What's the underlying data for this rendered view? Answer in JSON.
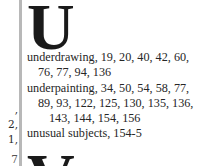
{
  "left_column": {
    "fragments": [
      {
        "text": ",",
        "top": 105
      },
      {
        "text": "2,",
        "top": 120
      },
      {
        "text": "1,",
        "top": 135
      },
      {
        "text": "7",
        "top": 153
      }
    ]
  },
  "section_u": {
    "letter": "U",
    "entries": [
      {
        "term": "underdrawing",
        "lines": [
          "underdrawing, 19, 20, 40, 42, 60,",
          "76, 77, 94, 136"
        ]
      },
      {
        "term": "underpainting",
        "lines": [
          "underpainting, 34, 50, 54, 58, 77,",
          "89, 93, 122, 125, 130, 135, 136,",
          "143, 144, 154, 156"
        ]
      },
      {
        "term": "unusual subjects",
        "lines": [
          "unusual subjects, 154-5"
        ]
      }
    ]
  },
  "section_v": {
    "letter": "V"
  },
  "colors": {
    "background": "#ffffff",
    "rule": "#b8b8b8",
    "text": "#262626"
  }
}
